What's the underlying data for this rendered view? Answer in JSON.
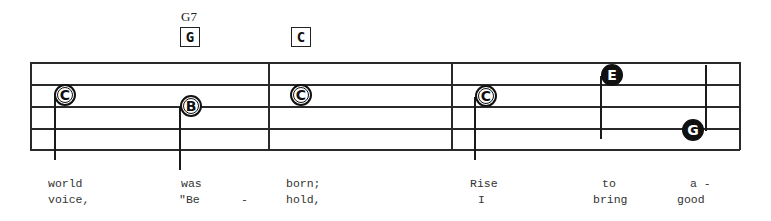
{
  "chords": [
    {
      "name": "G7",
      "box": "G",
      "x": 180
    },
    {
      "name": "",
      "box": "C",
      "x": 291
    }
  ],
  "staff": {
    "lines_y": [
      62,
      84,
      106,
      128,
      149
    ],
    "left_x": 30,
    "right_x": 739,
    "barlines_x": [
      30,
      268,
      451,
      705,
      739
    ]
  },
  "notes": [
    {
      "letter": "C",
      "style": "open",
      "x": 65,
      "y": 95,
      "stem": "down-left"
    },
    {
      "letter": "B",
      "style": "open",
      "x": 191,
      "y": 106,
      "stem": "down-left"
    },
    {
      "letter": "C",
      "style": "open",
      "x": 301,
      "y": 95,
      "stem": "none"
    },
    {
      "letter": "C",
      "style": "open",
      "x": 486,
      "y": 96,
      "stem": "down-left"
    },
    {
      "letter": "E",
      "style": "filled",
      "x": 612,
      "y": 75,
      "stem": "down-left"
    },
    {
      "letter": "G",
      "style": "filled",
      "x": 693,
      "y": 130,
      "stem": "up-right"
    }
  ],
  "lyrics": {
    "line1": [
      {
        "text": "world",
        "x": 48
      },
      {
        "text": "was",
        "x": 181
      },
      {
        "text": "born;",
        "x": 286
      },
      {
        "text": "Rise",
        "x": 470
      },
      {
        "text": "to",
        "x": 602
      },
      {
        "text": "a -",
        "x": 690
      }
    ],
    "line2": [
      {
        "text": "voice,",
        "x": 48
      },
      {
        "text": "\"Be",
        "x": 179
      },
      {
        "text": "-",
        "x": 241
      },
      {
        "text": "hold,",
        "x": 286
      },
      {
        "text": "I",
        "x": 478
      },
      {
        "text": "bring",
        "x": 593
      },
      {
        "text": "good",
        "x": 677
      }
    ]
  }
}
